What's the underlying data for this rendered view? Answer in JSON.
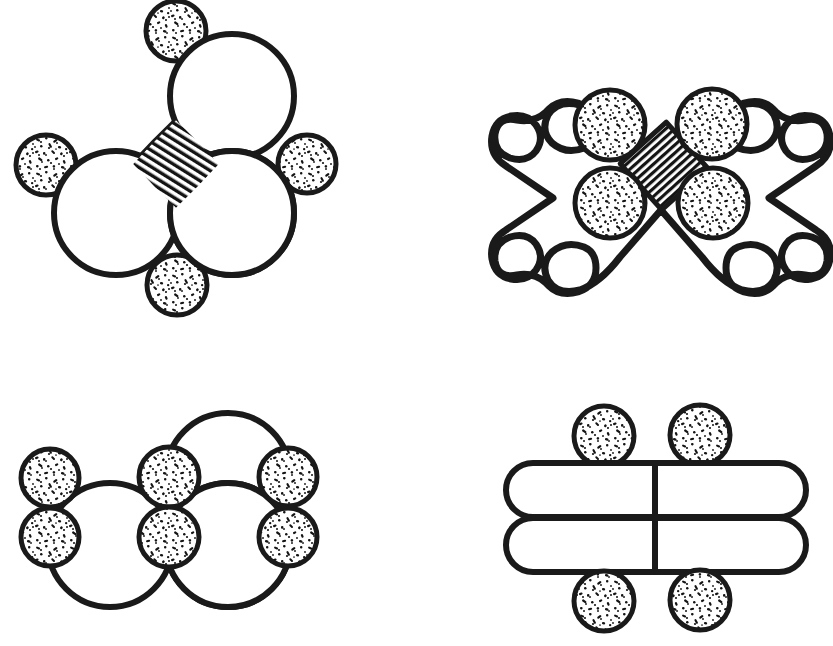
{
  "figure": {
    "background_color": "#ffffff",
    "stroke_color": "#1a1a1a",
    "fill_color": "#ffffff",
    "stipple_color": "#1a1a1a",
    "canvas": {
      "width": 833,
      "height": 646
    },
    "panels": [
      {
        "id": "panel-top-left",
        "name": "rosette-four-large-circles",
        "description": "Four large open circles in a 2x2 rosette with four stippled small circles at the outer mid-points and a hatched concave-diamond interstice at the centre.",
        "large_circle_stroke_width": 6,
        "small_circle_stroke_width": 5,
        "large_circles": [
          {
            "cx": 116,
            "cy": 93,
            "r": 62
          },
          {
            "cx": 232,
            "cy": 96,
            "r": 62
          },
          {
            "cx": 116,
            "cy": 213,
            "r": 62
          },
          {
            "cx": 232,
            "cy": 213,
            "r": 62
          }
        ],
        "small_circles": [
          {
            "cx": 176,
            "cy": 31,
            "r": 30,
            "position": "top"
          },
          {
            "cx": 46,
            "cy": 165,
            "r": 30,
            "position": "left"
          },
          {
            "cx": 307,
            "cy": 164,
            "r": 29,
            "position": "right"
          },
          {
            "cx": 177,
            "cy": 285,
            "r": 30,
            "position": "bottom"
          }
        ],
        "hatched_region": {
          "shape": "concave-diamond",
          "cx": 176,
          "cy": 164,
          "half_width": 43,
          "half_height": 44,
          "hatch_angle_deg": 58,
          "hatch_spacing": 7,
          "hatch_width": 3.4
        }
      },
      {
        "id": "panel-top-right",
        "name": "clover-x-eight-lobes",
        "description": "An X-shaped clover outline with eight rounded lobes, enclosing four stippled circles around a tilted hatched square.",
        "outline_stroke_width": 7,
        "small_circle_stroke_width": 5,
        "center": {
          "cx": 661,
          "cy": 165
        },
        "small_circles": [
          {
            "cx": 610,
            "cy": 125,
            "r": 35,
            "position": "top-left"
          },
          {
            "cx": 712,
            "cy": 124,
            "r": 35,
            "position": "top-right"
          },
          {
            "cx": 610,
            "cy": 203,
            "r": 35,
            "position": "bottom-left"
          },
          {
            "cx": 713,
            "cy": 203,
            "r": 35,
            "position": "bottom-right"
          }
        ],
        "hatched_region": {
          "shape": "tilted-square",
          "cx": 664,
          "cy": 166,
          "half_size": 31,
          "rotation_deg": -42,
          "hatch_angle_deg": 0,
          "hatch_spacing": 6,
          "hatch_width": 3.2
        }
      },
      {
        "id": "panel-bottom-left",
        "name": "four-circle-lattice-six-small",
        "description": "Four large open circles in a 2x2 block with six stippled small circles along the left, centre and right seam lines.",
        "large_circle_stroke_width": 6,
        "small_circle_stroke_width": 5,
        "large_circles": [
          {
            "cx": 110,
            "cy": 475,
            "rx": 62,
            "ry": 62
          },
          {
            "cx": 228,
            "cy": 475,
            "rx": 62,
            "ry": 62
          },
          {
            "cx": 110,
            "cy": 545,
            "rx": 62,
            "ry": 62
          },
          {
            "cx": 228,
            "cy": 545,
            "rx": 62,
            "ry": 62
          }
        ],
        "small_circles": [
          {
            "cx": 50,
            "cy": 478,
            "r": 29,
            "position": "left-upper"
          },
          {
            "cx": 50,
            "cy": 537,
            "r": 29,
            "position": "left-lower"
          },
          {
            "cx": 169,
            "cy": 477,
            "r": 30,
            "position": "centre-upper"
          },
          {
            "cx": 169,
            "cy": 537,
            "r": 30,
            "position": "centre-lower"
          },
          {
            "cx": 288,
            "cy": 477,
            "r": 29,
            "position": "right-upper"
          },
          {
            "cx": 288,
            "cy": 537,
            "r": 29,
            "position": "right-lower"
          }
        ]
      },
      {
        "id": "panel-bottom-right",
        "name": "stacked-stadium-pair",
        "description": "Two stacked stadium (capsule) bars divided by a central vertical line, with two stippled circles resting above and two below.",
        "stadium_stroke_width": 6,
        "small_circle_stroke_width": 5,
        "stadiums": [
          {
            "x": 506,
            "y": 463,
            "width": 300,
            "height": 54,
            "radius": 27,
            "position": "upper"
          },
          {
            "x": 506,
            "y": 518,
            "width": 300,
            "height": 54,
            "radius": 27,
            "position": "lower"
          }
        ],
        "divider": {
          "x": 655,
          "y1": 463,
          "y2": 572
        },
        "small_circles": [
          {
            "cx": 604,
            "cy": 436,
            "r": 30,
            "position": "top-left"
          },
          {
            "cx": 700,
            "cy": 435,
            "r": 30,
            "position": "top-right"
          },
          {
            "cx": 604,
            "cy": 601,
            "r": 30,
            "position": "bottom-left"
          },
          {
            "cx": 700,
            "cy": 600,
            "r": 30,
            "position": "bottom-right"
          }
        ]
      }
    ]
  }
}
